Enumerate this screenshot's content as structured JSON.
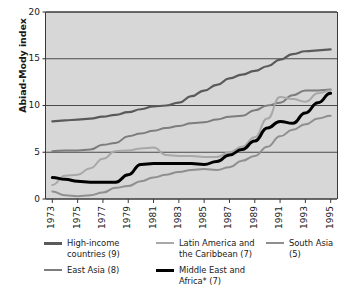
{
  "chart_data": {
    "type": "line",
    "title": "",
    "xlabel": "",
    "ylabel": "Abiad-Mody index",
    "ylim": [
      0,
      20
    ],
    "yticks": [
      0,
      5,
      10,
      15,
      20
    ],
    "ytick_labels": [
      "0",
      "5",
      "10",
      "15",
      "20"
    ],
    "xlim": [
      1972.5,
      1995.5
    ],
    "xticks": [
      1973,
      1975,
      1977,
      1979,
      1981,
      1983,
      1985,
      1987,
      1989,
      1991,
      1993,
      1995
    ],
    "xtick_labels": [
      "1973",
      "1975",
      "1977",
      "1979",
      "1981",
      "1983",
      "1985",
      "1987",
      "1989",
      "1991",
      "1993",
      "1995"
    ],
    "grid": "horizontal",
    "legend_position": "below",
    "plot_background": "#d7d7d7",
    "x": [
      1973,
      1974,
      1975,
      1976,
      1977,
      1978,
      1979,
      1980,
      1981,
      1982,
      1983,
      1984,
      1985,
      1986,
      1987,
      1988,
      1989,
      1990,
      1991,
      1992,
      1993,
      1994,
      1995
    ],
    "series": [
      {
        "name": "High-income countries (9)",
        "color": "#5a5a5a",
        "width": 2.2,
        "values": [
          8.3,
          8.4,
          8.5,
          8.6,
          8.8,
          9.0,
          9.3,
          9.6,
          9.9,
          10.0,
          10.3,
          11.0,
          11.6,
          12.2,
          12.9,
          13.3,
          13.7,
          14.2,
          14.9,
          15.5,
          15.8,
          15.9,
          16.0
        ]
      },
      {
        "name": "East Asia (8)",
        "color": "#7d7d7d",
        "width": 2.0,
        "values": [
          5.1,
          5.2,
          5.2,
          5.3,
          5.8,
          6.0,
          6.7,
          7.0,
          7.3,
          7.6,
          7.8,
          8.1,
          8.2,
          8.5,
          8.8,
          8.9,
          9.5,
          10.0,
          10.3,
          11.1,
          11.6,
          11.6,
          11.7
        ]
      },
      {
        "name": "Latin America and the Caribbean (7)",
        "color": "#a8a8a8",
        "width": 2.0,
        "values": [
          1.5,
          2.5,
          2.6,
          3.3,
          4.3,
          5.1,
          5.2,
          5.4,
          5.5,
          4.7,
          4.6,
          4.6,
          4.5,
          4.5,
          5.0,
          5.6,
          6.6,
          8.6,
          10.9,
          10.7,
          10.4,
          11.3,
          11.6
        ]
      },
      {
        "name": "South Asia (5)",
        "color": "#8f8f8f",
        "width": 2.0,
        "values": [
          0.8,
          0.4,
          0.3,
          0.4,
          0.7,
          1.2,
          1.4,
          1.9,
          2.3,
          2.6,
          2.9,
          3.1,
          3.2,
          3.1,
          3.4,
          4.1,
          4.6,
          5.6,
          6.7,
          7.4,
          8.0,
          8.6,
          8.9
        ]
      },
      {
        "name": "Middle East and Africa* (7)",
        "color": "#000000",
        "width": 3.0,
        "values": [
          2.3,
          2.1,
          1.9,
          1.8,
          1.8,
          1.8,
          2.6,
          3.7,
          3.8,
          3.8,
          3.8,
          3.8,
          3.7,
          4.0,
          4.7,
          5.3,
          6.2,
          7.6,
          8.3,
          8.1,
          9.2,
          10.3,
          11.3
        ]
      }
    ]
  },
  "legend": {
    "items": [
      {
        "label": "High-income\ncountries (9)",
        "color": "#5a5a5a",
        "width": 2.6
      },
      {
        "label": "Latin America and\nthe Caribbean (7)",
        "color": "#a8a8a8",
        "width": 2.4
      },
      {
        "label": "South Asia (5)",
        "color": "#8f8f8f",
        "width": 2.4
      },
      {
        "label": "East Asia (8)",
        "color": "#7d7d7d",
        "width": 2.4
      },
      {
        "label": "Middle East and\nAfrica* (7)",
        "color": "#000000",
        "width": 3.4
      }
    ]
  }
}
